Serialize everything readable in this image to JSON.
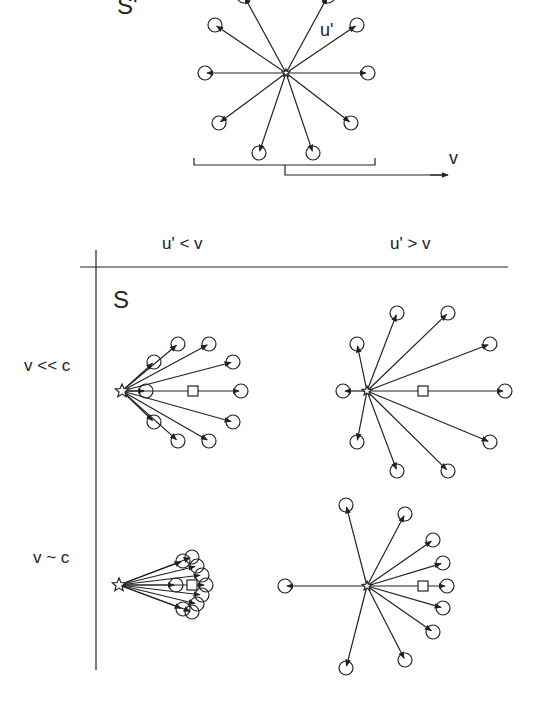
{
  "labels": {
    "frame_prime": "S'",
    "velocity_prime": "u'",
    "frame_velocity": "v",
    "col_slow": "u' < v",
    "col_fast": "u' > v",
    "frame_lab": "S",
    "row_nonrel": "v << c",
    "row_rel": "v ~ c"
  },
  "colors": {
    "ink": "#222222",
    "background": "#ffffff"
  },
  "panels": [
    {
      "id": "rest-frame",
      "center": [
        286,
        73
      ],
      "radius": 85,
      "description": "isotropic emission, 10 directions"
    },
    {
      "id": "slow-nonrel",
      "source": [
        122,
        391
      ],
      "square": [
        193,
        391
      ]
    },
    {
      "id": "fast-nonrel",
      "source": [
        367,
        391
      ],
      "square": [
        423,
        391
      ]
    },
    {
      "id": "slow-rel",
      "source": [
        119,
        585
      ],
      "square": [
        192,
        585
      ]
    },
    {
      "id": "fast-rel",
      "source": [
        367,
        586
      ],
      "square": [
        423,
        586
      ]
    }
  ]
}
